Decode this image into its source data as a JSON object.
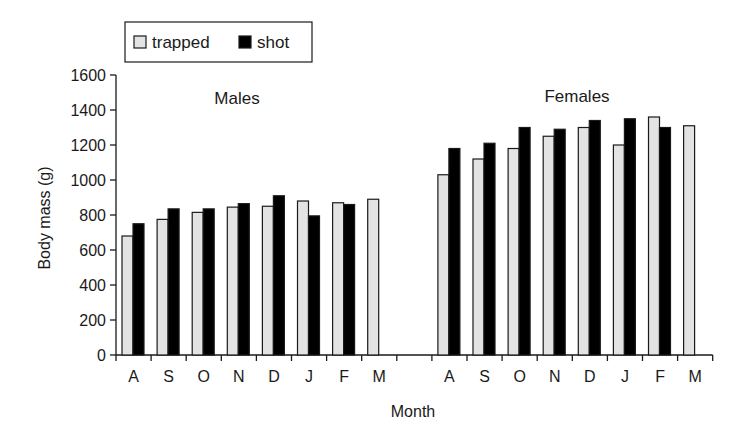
{
  "chart_data": {
    "type": "bar",
    "title": "",
    "xlabel": "Month",
    "ylabel": "Body mass (g)",
    "ylim": [
      0,
      1600
    ],
    "yticks": [
      0,
      200,
      400,
      600,
      800,
      1000,
      1200,
      1400,
      1600
    ],
    "grid": false,
    "legend_position": "top-left (outside plot, boxed)",
    "legend": [
      {
        "name": "trapped",
        "color": "#e3e3e3"
      },
      {
        "name": "shot",
        "color": "#000000"
      }
    ],
    "groups": [
      {
        "label": "Males",
        "categories": [
          "A",
          "S",
          "O",
          "N",
          "D",
          "J",
          "F",
          "M"
        ],
        "series": [
          {
            "name": "trapped",
            "values": [
              680,
              775,
              815,
              845,
              850,
              880,
              870,
              890
            ]
          },
          {
            "name": "shot",
            "values": [
              750,
              835,
              835,
              865,
              910,
              795,
              860,
              null
            ]
          }
        ]
      },
      {
        "label": "Females",
        "categories": [
          "A",
          "S",
          "O",
          "N",
          "D",
          "J",
          "F",
          "M"
        ],
        "series": [
          {
            "name": "trapped",
            "values": [
              1030,
              1120,
              1180,
              1250,
              1300,
              1200,
              1360,
              1310
            ]
          },
          {
            "name": "shot",
            "values": [
              1180,
              1210,
              1300,
              1290,
              1340,
              1350,
              1300,
              null
            ]
          }
        ]
      }
    ]
  },
  "colors": {
    "trapped_fill": "#e3e3e3",
    "shot_fill": "#000000",
    "stroke": "#1a1a1a"
  }
}
